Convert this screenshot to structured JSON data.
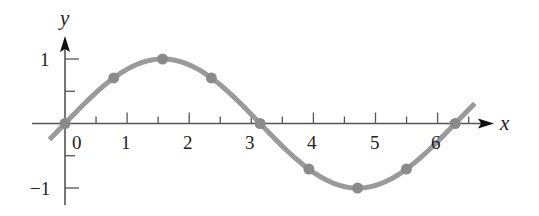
{
  "chart_data": {
    "type": "line",
    "title": "",
    "function": "y = sin x",
    "xlabel": "x",
    "ylabel": "y",
    "xlim": [
      -0.5,
      6.9
    ],
    "ylim": [
      -1.1,
      1.2
    ],
    "x_ticks_major": [
      0,
      1,
      2,
      3,
      4,
      5,
      6
    ],
    "x_ticks_minor": [
      0.5,
      1.5,
      2.5,
      3.5,
      4.5,
      5.5,
      6.5
    ],
    "x_tick_labels": [
      "0",
      "1",
      "2",
      "3",
      "4",
      "5",
      "6"
    ],
    "y_ticks": [
      1,
      0.5,
      -0.5,
      -1
    ],
    "y_tick_labels": [
      "1",
      "−1"
    ],
    "grid": false,
    "legend": null,
    "series": [
      {
        "name": "sin x",
        "curve_x_range": [
          -0.25,
          6.6
        ],
        "color": "#9a9a9a"
      }
    ],
    "points": {
      "x": [
        0,
        0.785,
        1.571,
        2.356,
        3.142,
        3.927,
        4.712,
        5.498,
        6.283
      ],
      "y": [
        0,
        0.707,
        1,
        0.707,
        0,
        -0.707,
        -1,
        -0.707,
        0
      ],
      "color": "#8a8a8a"
    }
  },
  "labels": {
    "x_axis": "x",
    "y_axis": "y",
    "y_one": "1",
    "y_neg_one": "−1",
    "x0": "0",
    "x1": "1",
    "x2": "2",
    "x3": "3",
    "x4": "4",
    "x5": "5",
    "x6": "6"
  },
  "colors": {
    "axis": "#555555",
    "curve": "#9a9a9a",
    "points": "#8a8a8a",
    "text": "#222222"
  }
}
